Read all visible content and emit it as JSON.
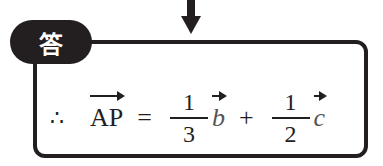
{
  "badge": {
    "label": "答"
  },
  "equation": {
    "therefore": "∴",
    "lhs": "AP",
    "equals": "=",
    "term1": {
      "numerator": "1",
      "denominator": "3",
      "vector": "b"
    },
    "plus": "+",
    "term2": {
      "numerator": "1",
      "denominator": "2",
      "vector": "c"
    }
  },
  "colors": {
    "ink": "#231f20"
  }
}
